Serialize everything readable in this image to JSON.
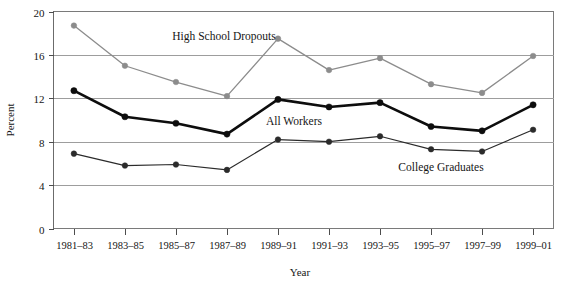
{
  "chart_data": {
    "type": "line",
    "title": "",
    "xlabel": "Year",
    "ylabel": "Percent",
    "categories": [
      "1981–83",
      "1983–85",
      "1985–87",
      "1987–89",
      "1989–91",
      "1991–93",
      "1993–95",
      "1995–97",
      "1997–99",
      "1999–01"
    ],
    "ylim": [
      0,
      20
    ],
    "yticks": [
      0,
      4,
      8,
      12,
      16,
      20
    ],
    "ytick_labels": [
      "0",
      "4",
      "8",
      "12",
      "16",
      "20"
    ],
    "grid": "horizontal",
    "legend_position": "inline-annotations",
    "series": [
      {
        "name": "High School Dropouts",
        "color": "#8c8c8c",
        "marker_color": "#8c8c8c",
        "line_width": 1.3,
        "label_x_category_index": 3,
        "values": [
          18.7,
          15.0,
          13.5,
          12.2,
          17.5,
          14.6,
          15.7,
          13.3,
          12.5,
          15.9
        ]
      },
      {
        "name": "All Workers",
        "color": "#0d0d0d",
        "marker_color": "#0d0d0d",
        "line_width": 2.6,
        "label_x_category_index": 4,
        "values": [
          12.7,
          10.3,
          9.7,
          8.7,
          11.9,
          11.2,
          11.6,
          9.4,
          9.0,
          11.4
        ]
      },
      {
        "name": "College Graduates",
        "color": "#2b2b2b",
        "marker_color": "#2b2b2b",
        "line_width": 1.2,
        "label_x_category_index": 7,
        "values": [
          6.9,
          5.8,
          5.9,
          5.4,
          8.2,
          8.0,
          8.5,
          7.3,
          7.1,
          9.1
        ]
      }
    ],
    "annotations": [
      {
        "text": "High School Dropouts",
        "x": 224,
        "y": 40
      },
      {
        "text": "All Workers",
        "x": 294,
        "y": 125
      },
      {
        "text": "College Graduates",
        "x": 441,
        "y": 171
      }
    ]
  }
}
